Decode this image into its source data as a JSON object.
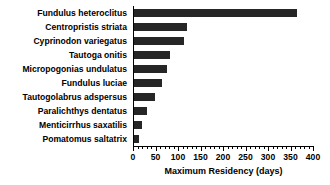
{
  "chart_data": {
    "type": "bar",
    "orientation": "horizontal",
    "title": "",
    "xlabel": "Maximum Residency (days)",
    "ylabel": "",
    "xlim": [
      0,
      400
    ],
    "xticks": [
      0,
      50,
      100,
      150,
      200,
      250,
      300,
      350,
      400
    ],
    "xtick_labels": [
      "0",
      "50",
      "100",
      "150",
      "200",
      "250",
      "300",
      "350",
      "400"
    ],
    "minor_tick_interval": 10,
    "grid": false,
    "legend": null,
    "bar_color": "#262626",
    "axis_color": "#000000",
    "background_color": "#ffffff",
    "categories": [
      "Fundulus heteroclitus",
      "Centropristis striata",
      "Cyprinodon variegatus",
      "Tautoga onitis",
      "Micropogonias undulatus",
      "Fundulus luciae",
      "Tautogolabrus adspersus",
      "Paralichthys dentatus",
      "Menticirrhus saxatilis",
      "Pomatomus saltatrix"
    ],
    "values": [
      365,
      120,
      113,
      82,
      76,
      65,
      49,
      31,
      19,
      14
    ]
  }
}
